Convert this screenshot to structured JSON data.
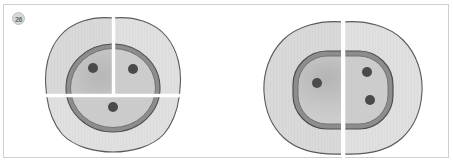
{
  "figure": {
    "badge_label": "26",
    "canvas": {
      "width": 453,
      "height": 163,
      "background": "#ffffff",
      "border_color": "#cfcfcf"
    },
    "palette": {
      "body_fill": "#d6d6d6",
      "body_fill_light": "#dedede",
      "body_stroke": "#5a5a5a",
      "ring_band": "#8d8d8d",
      "ring_stroke": "#4f4f4f",
      "inner_fill": "#c6c6c6",
      "inner_fill_light": "#d0d0d0",
      "dot_fill": "#4a4a4a",
      "split_line": "#ffffff",
      "badge_fill": "#d8d8d8",
      "badge_text": "#6a6a6a"
    },
    "specimens": [
      {
        "id": "left-specimen",
        "name": "left-cross-section",
        "outline_shape": "rounded-square-blob",
        "segments": [
          "upper-left-quadrant",
          "upper-right-quadrant",
          "lower-half"
        ],
        "split_lines": [
          {
            "orientation": "vertical",
            "extent": "upper-half"
          },
          {
            "orientation": "horizontal",
            "extent": "full-width"
          }
        ],
        "inner_ring_shape": "oval",
        "dots": [
          {
            "name": "dot-upper-left",
            "cx": 93,
            "cy": 68,
            "r": 5
          },
          {
            "name": "dot-upper-right",
            "cx": 133,
            "cy": 69,
            "r": 5
          },
          {
            "name": "dot-lower-center",
            "cx": 113,
            "cy": 107,
            "r": 5
          }
        ],
        "dot_count": 3
      },
      {
        "id": "right-specimen",
        "name": "right-cross-section",
        "outline_shape": "rounded-blob",
        "segments": [
          "left-half",
          "right-half"
        ],
        "split_lines": [
          {
            "orientation": "vertical",
            "extent": "full-height"
          }
        ],
        "inner_ring_shape": "rounded-rectangle",
        "dots": [
          {
            "name": "dot-left-middle",
            "cx": 317,
            "cy": 83,
            "r": 5
          },
          {
            "name": "dot-right-upper",
            "cx": 367,
            "cy": 72,
            "r": 5
          },
          {
            "name": "dot-right-lower",
            "cx": 370,
            "cy": 100,
            "r": 5
          }
        ],
        "dot_count": 3
      }
    ]
  }
}
